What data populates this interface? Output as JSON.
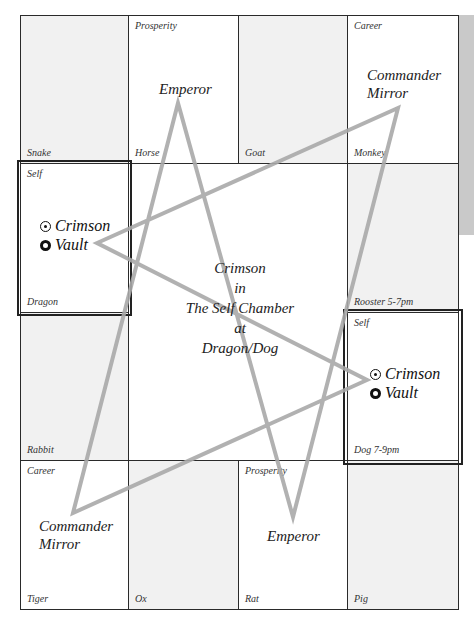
{
  "diagram": {
    "title": "Crimson in The Self Chamber at Dragon/Dog",
    "center": {
      "lines": [
        "Crimson",
        "in",
        "The Self Chamber",
        "at",
        "Dragon/Dog"
      ]
    },
    "cells": {
      "snake": {
        "branch": "Snake"
      },
      "horse": {
        "branch": "Horse",
        "palace": "Prosperity",
        "star": "Emperor"
      },
      "goat": {
        "branch": "Goat"
      },
      "monkey": {
        "branch": "Monkey",
        "palace": "Career",
        "star_line1": "Commander",
        "star_line2": "Mirror"
      },
      "dragon": {
        "branch": "Dragon",
        "palace": "Self"
      },
      "rooster": {
        "branch": "Rooster 5-7pm"
      },
      "rabbit": {
        "branch": "Rabbit"
      },
      "dog": {
        "branch": "Dog 7-9pm",
        "palace": "Self"
      },
      "tiger": {
        "branch": "Tiger",
        "palace": "Career",
        "star_line1": "Commander",
        "star_line2": "Mirror"
      },
      "ox": {
        "branch": "Ox"
      },
      "rat": {
        "branch": "Rat",
        "palace": "Prosperity",
        "star": "Emperor"
      },
      "pig": {
        "branch": "Pig"
      }
    },
    "self_stars": {
      "primary": {
        "symbol": "sun-circle-icon",
        "label": "Crimson"
      },
      "secondary": {
        "symbol": "ring-icon",
        "label": "Vault"
      }
    },
    "colors": {
      "grid_line": "#2a2a2a",
      "shaded_cell": "#f1f1f1",
      "star_lines": "#a8a8a8",
      "side_strip": "#c9c9c9"
    }
  }
}
